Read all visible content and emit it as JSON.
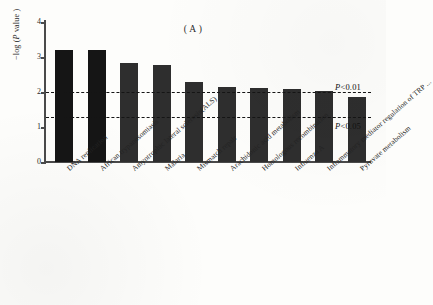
{
  "figure": {
    "panel_label_left": "(",
    "panel_label": "A",
    "panel_label_right": ")"
  },
  "axes": {
    "y_title_prefix": "−log (",
    "y_title_italic": "P",
    "y_title_suffix": " value )",
    "y_ticks": [
      "0",
      "1",
      "2",
      "3",
      "4"
    ],
    "y_tick_values": [
      0,
      1,
      2,
      3,
      4
    ]
  },
  "thresholds": [
    {
      "name": "p001",
      "label_prefix": "P",
      "label_suffix": "<0.01",
      "value": 2.0
    },
    {
      "name": "p005",
      "label_prefix": "P",
      "label_suffix": "<0.05",
      "value": 1.3
    }
  ],
  "chart_data": {
    "type": "bar",
    "xlabel": "",
    "ylabel": "-log ( P value )",
    "ylim": [
      0,
      4
    ],
    "grid": false,
    "legend": "none",
    "categories": [
      "DNA replication",
      "African trypanosomiasis",
      "Amyotrophic lateral sclerosis(ALS)",
      "Malaria",
      "Mismatch repair",
      "Arachidonic acid metabolism",
      "Homologous recombination",
      "Influenza A",
      "Inflammatory mediator regulation of TRP ...",
      "Pyruvate metabolism"
    ],
    "values": [
      3.2,
      3.2,
      2.82,
      2.78,
      2.3,
      2.15,
      2.12,
      2.08,
      2.02,
      1.86
    ],
    "annotations": [
      {
        "text": "P<0.01",
        "y": 2.0,
        "type": "threshold-line"
      },
      {
        "text": "P<0.05",
        "y": 1.3,
        "type": "threshold-line"
      }
    ]
  }
}
